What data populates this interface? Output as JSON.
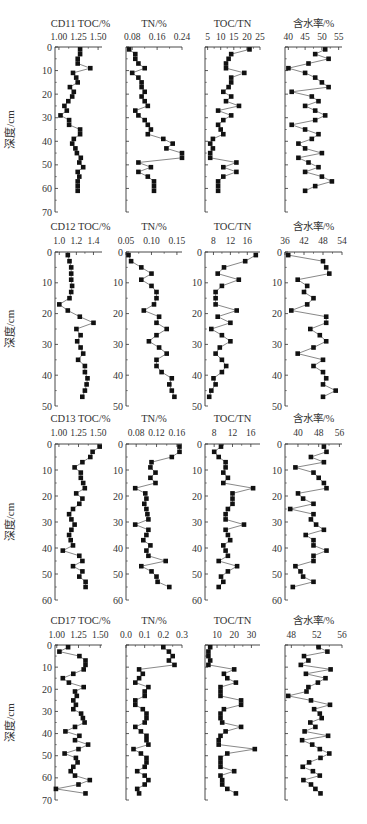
{
  "figure": {
    "ylabel": "深度/cm",
    "caption": ""
  },
  "chart_data": [
    {
      "core": "CD11",
      "type": "line",
      "ylabel": "深度/cm",
      "ylim": [
        0,
        70
      ],
      "yticks": [
        0,
        10,
        20,
        30,
        40,
        50,
        60,
        70
      ],
      "depth": [
        1,
        3,
        5,
        7,
        9,
        11,
        13,
        15,
        17,
        19,
        21,
        23,
        25,
        27,
        29,
        31,
        33,
        35,
        37,
        39,
        41,
        43,
        45,
        47,
        49,
        51,
        53,
        55,
        57,
        59,
        61
      ],
      "panels": [
        {
          "title": "CD11  TOC/%",
          "xlim": [
            0.95,
            1.55
          ],
          "xticks": [
            "1.00",
            "1.25",
            "1.50"
          ],
          "xtickvals": [
            1.0,
            1.25,
            1.5
          ],
          "values": [
            1.27,
            1.27,
            1.24,
            1.24,
            1.4,
            1.18,
            1.22,
            1.24,
            1.14,
            1.19,
            1.17,
            1.12,
            1.07,
            1.1,
            1.02,
            1.13,
            1.13,
            1.27,
            1.27,
            1.19,
            1.17,
            1.21,
            1.23,
            1.28,
            1.26,
            1.31,
            1.24,
            1.26,
            1.24,
            1.24,
            1.24
          ]
        },
        {
          "title": "TN/%",
          "xlim": [
            0.06,
            0.24
          ],
          "xticks": [
            "0.08",
            "0.16",
            "0.24"
          ],
          "xtickvals": [
            0.08,
            0.16,
            0.24
          ],
          "values": [
            0.07,
            0.09,
            0.09,
            0.1,
            0.12,
            0.08,
            0.1,
            0.11,
            0.11,
            0.12,
            0.11,
            0.12,
            0.13,
            0.09,
            0.1,
            0.12,
            0.13,
            0.14,
            0.13,
            0.18,
            0.21,
            0.19,
            0.24,
            0.24,
            0.1,
            0.14,
            0.1,
            0.13,
            0.15,
            0.15,
            0.15
          ]
        },
        {
          "title": "TOC/TN",
          "xlim": [
            4,
            25
          ],
          "xticks": [
            "5",
            "10",
            "15",
            "20",
            "25"
          ],
          "xtickvals": [
            5,
            10,
            15,
            20,
            25
          ],
          "values": [
            21,
            14,
            13,
            12,
            12,
            19,
            14,
            14,
            13,
            11,
            14,
            12,
            17,
            9,
            14,
            11,
            9,
            10,
            11,
            7,
            6,
            7,
            6,
            6,
            16,
            11,
            16,
            11,
            9,
            9,
            9
          ]
        },
        {
          "title": "含水率/%",
          "xlim": [
            39,
            56
          ],
          "xticks": [
            "40",
            "45",
            "50",
            "55"
          ],
          "xtickvals": [
            40,
            45,
            50,
            55
          ],
          "values": [
            51,
            48,
            52,
            46,
            40,
            45,
            48,
            50,
            52,
            41,
            47,
            49,
            45,
            48,
            51,
            48,
            41,
            45,
            49,
            47,
            43,
            45,
            50,
            43,
            46,
            49,
            45,
            50,
            53,
            48,
            45
          ]
        }
      ]
    },
    {
      "core": "CD12",
      "type": "line",
      "ylabel": "深度/cm",
      "ylim": [
        0,
        50
      ],
      "yticks": [
        0,
        10,
        20,
        30,
        40,
        50
      ],
      "depth": [
        1,
        3,
        5,
        7,
        9,
        11,
        13,
        15,
        17,
        19,
        21,
        23,
        25,
        27,
        29,
        31,
        33,
        35,
        37,
        39,
        41,
        43,
        45,
        47
      ],
      "panels": [
        {
          "title": "CD12  TOC/%",
          "xlim": [
            0.95,
            1.5
          ],
          "xticks": [
            "1.0",
            "1.2",
            "1.4"
          ],
          "xtickvals": [
            1.0,
            1.2,
            1.4
          ],
          "values": [
            1.1,
            1.12,
            1.14,
            1.14,
            1.14,
            1.15,
            1.14,
            1.12,
            1.0,
            1.1,
            1.24,
            1.4,
            1.2,
            1.25,
            1.21,
            1.25,
            1.28,
            1.22,
            1.3,
            1.3,
            1.33,
            1.32,
            1.3,
            1.27
          ]
        },
        {
          "title": "TN/%",
          "xlim": [
            0.05,
            0.16
          ],
          "xticks": [
            "0.05",
            "0.10",
            "0.15"
          ],
          "xtickvals": [
            0.05,
            0.1,
            0.15
          ],
          "values": [
            0.055,
            0.06,
            0.08,
            0.1,
            0.08,
            0.1,
            0.11,
            0.11,
            0.105,
            0.085,
            0.115,
            0.11,
            0.13,
            0.11,
            0.095,
            0.115,
            0.13,
            0.11,
            0.11,
            0.12,
            0.14,
            0.135,
            0.14,
            0.145
          ]
        },
        {
          "title": "TOC/TN",
          "xlim": [
            6,
            19
          ],
          "xticks": [
            "8",
            "12",
            "16"
          ],
          "xtickvals": [
            8,
            12,
            16
          ],
          "values": [
            18,
            15.5,
            10.5,
            9,
            14,
            10,
            8.5,
            8.5,
            8.5,
            13.5,
            9,
            12,
            7.5,
            10,
            12,
            9.5,
            8.5,
            10,
            11,
            10,
            8,
            8.5,
            7.5,
            7
          ]
        },
        {
          "title": "含水率/%",
          "xlim": [
            36,
            54
          ],
          "xticks": [
            "36",
            "42",
            "48",
            "54"
          ],
          "xtickvals": [
            36,
            42,
            48,
            54
          ],
          "values": [
            37,
            48,
            49,
            50,
            40,
            43,
            42,
            45,
            43,
            38,
            49,
            49,
            44,
            47,
            49,
            45,
            40,
            48,
            45,
            48,
            49,
            48,
            52,
            48
          ]
        }
      ]
    },
    {
      "core": "CD13",
      "type": "line",
      "ylabel": "深度/cm",
      "ylim": [
        0,
        60
      ],
      "yticks": [
        0,
        10,
        20,
        30,
        40,
        50,
        60
      ],
      "depth": [
        1,
        3,
        5,
        7,
        9,
        11,
        13,
        15,
        17,
        19,
        21,
        23,
        25,
        27,
        29,
        31,
        33,
        35,
        37,
        39,
        41,
        43,
        45,
        47,
        49,
        51,
        53,
        55
      ],
      "panels": [
        {
          "title": "CD13  TOC/%",
          "xlim": [
            0.95,
            1.55
          ],
          "xticks": [
            "1.00",
            "1.25",
            "1.50"
          ],
          "xtickvals": [
            1.0,
            1.25,
            1.5
          ],
          "values": [
            1.52,
            1.43,
            1.4,
            1.3,
            1.2,
            1.28,
            1.28,
            1.31,
            1.33,
            1.22,
            1.3,
            1.26,
            1.18,
            1.13,
            1.16,
            1.2,
            1.16,
            1.13,
            1.15,
            1.18,
            1.05,
            1.26,
            1.3,
            1.18,
            1.3,
            1.26,
            1.34,
            1.34
          ]
        },
        {
          "title": "TN/%",
          "xlim": [
            0.06,
            0.17
          ],
          "xticks": [
            "0.08",
            "0.12",
            "0.16"
          ],
          "xtickvals": [
            0.08,
            0.12,
            0.16
          ],
          "values": [
            0.165,
            0.165,
            0.15,
            0.11,
            0.108,
            0.118,
            0.108,
            0.118,
            0.078,
            0.098,
            0.1,
            0.096,
            0.1,
            0.102,
            0.104,
            0.078,
            0.104,
            0.1,
            0.094,
            0.108,
            0.1,
            0.104,
            0.138,
            0.09,
            0.11,
            0.12,
            0.122,
            0.145
          ]
        },
        {
          "title": "TOC/TN",
          "xlim": [
            6,
            18
          ],
          "xticks": [
            "8",
            "12",
            "16"
          ],
          "xtickvals": [
            8,
            12,
            16
          ],
          "values": [
            9.5,
            8,
            9,
            10.5,
            10.5,
            10,
            11,
            10,
            16.5,
            12,
            12,
            12,
            11,
            10.5,
            10.5,
            14.5,
            10.5,
            11,
            11.5,
            10,
            10.5,
            11,
            9,
            13,
            11,
            9.5,
            10,
            9
          ]
        },
        {
          "title": "含水率/%",
          "xlim": [
            35,
            57
          ],
          "xticks": [
            "40",
            "48",
            "56"
          ],
          "xtickvals": [
            40,
            48,
            56
          ],
          "values": [
            50,
            51,
            45,
            50,
            39,
            46,
            48,
            50,
            51,
            40,
            42,
            46,
            37,
            46,
            45,
            47,
            50,
            43,
            46,
            46,
            51,
            46,
            46,
            39,
            41,
            42,
            46,
            38
          ]
        }
      ]
    },
    {
      "core": "CD17",
      "type": "line",
      "ylabel": "深度/cm",
      "ylim": [
        0,
        70
      ],
      "yticks": [
        0,
        10,
        20,
        30,
        40,
        50,
        60,
        70
      ],
      "depth": [
        1,
        3,
        5,
        7,
        9,
        11,
        13,
        15,
        17,
        19,
        21,
        23,
        25,
        27,
        29,
        31,
        33,
        35,
        37,
        39,
        41,
        43,
        45,
        47,
        49,
        51,
        53,
        55,
        57,
        59,
        61,
        63,
        65,
        67
      ],
      "panels": [
        {
          "title": "CD17  TOC/%",
          "xlim": [
            0.98,
            1.52
          ],
          "xticks": [
            "1.00",
            "1.25",
            "1.50"
          ],
          "xtickvals": [
            1.0,
            1.25,
            1.5
          ],
          "values": [
            1.13,
            1.03,
            1.26,
            1.33,
            1.33,
            1.31,
            1.19,
            1.07,
            1.14,
            1.31,
            1.21,
            1.23,
            1.19,
            1.22,
            1.19,
            1.28,
            1.3,
            1.32,
            1.21,
            1.1,
            1.26,
            1.21,
            1.36,
            1.25,
            1.09,
            1.22,
            1.24,
            1.19,
            1.16,
            1.21,
            1.38,
            1.25,
            0.99,
            1.33
          ]
        },
        {
          "title": "TN/%",
          "xlim": [
            0.0,
            0.3
          ],
          "xticks": [
            "0.0",
            "0.1",
            "0.2",
            "0.3"
          ],
          "xtickvals": [
            0.0,
            0.1,
            0.2,
            0.3
          ],
          "values": [
            0.2,
            0.23,
            0.25,
            0.23,
            0.26,
            0.07,
            0.09,
            0.07,
            0.05,
            0.12,
            0.1,
            0.1,
            0.05,
            0.05,
            0.09,
            0.11,
            0.11,
            0.1,
            0.05,
            0.08,
            0.11,
            0.11,
            0.12,
            0.04,
            0.08,
            0.11,
            0.11,
            0.1,
            0.06,
            0.1,
            0.12,
            0.1,
            0.06,
            0.07
          ]
        },
        {
          "title": "TOC/TN",
          "xlim": [
            3,
            35
          ],
          "xticks": [
            "10",
            "20",
            "30"
          ],
          "xtickvals": [
            10,
            20,
            30
          ],
          "values": [
            6,
            5,
            5,
            6,
            5,
            20,
            14,
            16,
            21,
            12,
            12,
            12,
            24,
            24,
            14,
            12,
            12,
            13,
            24,
            15,
            12,
            11,
            11,
            32,
            16,
            12,
            12,
            12,
            20,
            12,
            13,
            13,
            16,
            21
          ]
        },
        {
          "title": "含水率/%",
          "xlim": [
            47,
            56
          ],
          "xticks": [
            "48",
            "52",
            "56"
          ],
          "xtickvals": [
            48,
            52,
            56
          ],
          "values": [
            52.3,
            53.7,
            50.0,
            50.7,
            49.5,
            54.2,
            50.3,
            53.4,
            52.2,
            50.7,
            50.4,
            47.5,
            51.1,
            54.1,
            51.6,
            52.5,
            52.8,
            51.0,
            51.8,
            50.1,
            53.8,
            49.7,
            51.3,
            52.5,
            54.0,
            52.6,
            50.8,
            49.8,
            51.4,
            52.5,
            49.9,
            51.1,
            51.8,
            52.6
          ]
        }
      ]
    }
  ]
}
